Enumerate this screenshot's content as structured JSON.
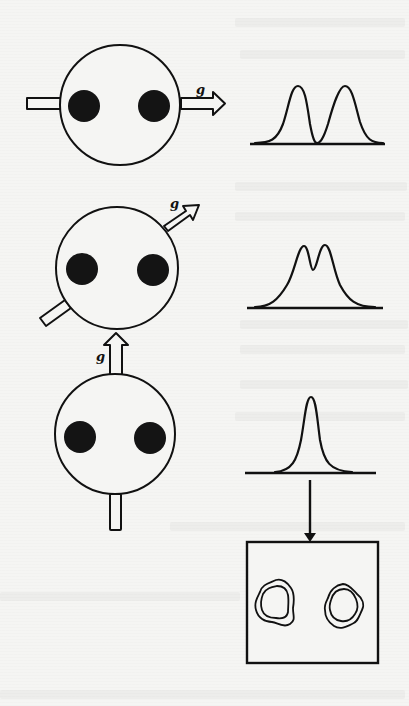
{
  "figure": {
    "type": "dimer-orientation-vs-spectrum-diagram",
    "colors": {
      "ink": "#111111",
      "paper": "#f5f5f3",
      "dot_fill": "#141414"
    },
    "panels": [
      {
        "id": "panel-1",
        "orientation": "g perpendicular to dot axis... arrow along dot axis (horizontal)",
        "g_label": "g",
        "arrow_direction": "horizontal-right",
        "spectrum": "two-well-separated-peaks"
      },
      {
        "id": "panel-2",
        "g_label": "g",
        "arrow_direction": "diagonal-up-right",
        "spectrum": "two-overlapping-peaks"
      },
      {
        "id": "panel-3",
        "g_label": "g",
        "arrow_direction": "vertical-up",
        "spectrum": "single-peak"
      }
    ],
    "result_box": {
      "id": "image-panel",
      "content": "two-contoured-blobs",
      "arrow_from": "panel-3-spectrum"
    }
  }
}
